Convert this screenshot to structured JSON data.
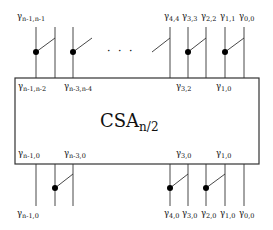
{
  "block": {
    "name": "CSA",
    "subscript": "n/2"
  },
  "top_labels": [
    {
      "sym": "γ",
      "sub": "n-1,n-1",
      "x": 17,
      "y": 12
    },
    {
      "sym": "γ",
      "sub": "4,4",
      "x": 164,
      "y": 12
    },
    {
      "sym": "γ",
      "sub": "3,3",
      "x": 182,
      "y": 12
    },
    {
      "sym": "γ",
      "sub": "2,2",
      "x": 201,
      "y": 12
    },
    {
      "sym": "γ",
      "sub": "1,1",
      "x": 220,
      "y": 12
    },
    {
      "sym": "γ",
      "sub": "0,0",
      "x": 239,
      "y": 12
    }
  ],
  "inner_top_labels": [
    {
      "sym": "γ",
      "sub": "n-1,n-2",
      "x": 18,
      "y": 82
    },
    {
      "sym": "γ",
      "sub": "n-3,n-4",
      "x": 64,
      "y": 82
    },
    {
      "sym": "γ",
      "sub": "3,2",
      "x": 176,
      "y": 82
    },
    {
      "sym": "γ",
      "sub": "1,0",
      "x": 216,
      "y": 82
    }
  ],
  "inner_bottom_labels": [
    {
      "sym": "γ",
      "sub": "n-1,0",
      "x": 18,
      "y": 149
    },
    {
      "sym": "γ",
      "sub": "n-3,0",
      "x": 64,
      "y": 149
    },
    {
      "sym": "γ",
      "sub": "3,0",
      "x": 176,
      "y": 149
    },
    {
      "sym": "γ",
      "sub": "1,0",
      "x": 216,
      "y": 149
    }
  ],
  "bottom_labels": [
    {
      "sym": "γ",
      "sub": "n-1,0",
      "x": 17,
      "y": 209
    },
    {
      "sym": "γ",
      "sub": "4,0",
      "x": 164,
      "y": 209
    },
    {
      "sym": "γ",
      "sub": "3,0",
      "x": 182,
      "y": 209
    },
    {
      "sym": "γ",
      "sub": "2,0",
      "x": 201,
      "y": 209
    },
    {
      "sym": "γ",
      "sub": "1,0",
      "x": 220,
      "y": 209
    },
    {
      "sym": "γ",
      "sub": "0,0",
      "x": 239,
      "y": 209
    }
  ],
  "ellipsis": "· · ·"
}
